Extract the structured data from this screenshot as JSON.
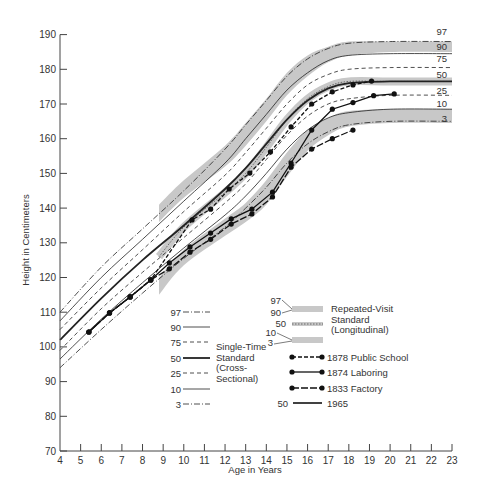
{
  "chart_data": {
    "type": "line",
    "title": "",
    "xlabel": "Age in Years",
    "ylabel": "Height in Centimeters",
    "xlim": [
      4,
      23
    ],
    "ylim": [
      70,
      190
    ],
    "x_ticks": [
      4,
      5,
      6,
      7,
      8,
      9,
      10,
      11,
      12,
      13,
      14,
      15,
      16,
      17,
      18,
      19,
      20,
      21,
      22,
      23
    ],
    "y_ticks": [
      70,
      80,
      90,
      100,
      110,
      120,
      130,
      140,
      150,
      160,
      170,
      180,
      190
    ],
    "grid": false,
    "cross_sectional_percentiles": [
      {
        "name": "97",
        "style": "dash-dot",
        "points": [
          [
            4,
            110
          ],
          [
            6,
            123
          ],
          [
            8,
            134
          ],
          [
            10,
            145
          ],
          [
            12,
            157
          ],
          [
            13,
            164
          ],
          [
            14,
            171
          ],
          [
            15,
            178
          ],
          [
            16,
            183
          ],
          [
            17,
            186
          ],
          [
            18,
            187.5
          ],
          [
            20,
            188
          ],
          [
            23,
            188
          ]
        ]
      },
      {
        "name": "90",
        "style": "solid-thin",
        "points": [
          [
            4,
            107.5
          ],
          [
            6,
            120
          ],
          [
            8,
            131
          ],
          [
            10,
            142
          ],
          [
            12,
            153
          ],
          [
            13,
            160
          ],
          [
            14,
            167
          ],
          [
            15,
            174
          ],
          [
            16,
            179
          ],
          [
            17,
            182.5
          ],
          [
            18,
            184
          ],
          [
            20,
            184.5
          ],
          [
            23,
            184.5
          ]
        ]
      },
      {
        "name": "75",
        "style": "dashed",
        "points": [
          [
            4,
            105
          ],
          [
            6,
            117
          ],
          [
            8,
            128
          ],
          [
            10,
            139
          ],
          [
            12,
            149.5
          ],
          [
            13,
            156
          ],
          [
            14,
            163
          ],
          [
            15,
            170
          ],
          [
            16,
            175.5
          ],
          [
            17,
            178.5
          ],
          [
            18,
            180
          ],
          [
            20,
            180.5
          ],
          [
            23,
            180.5
          ]
        ]
      },
      {
        "name": "50",
        "style": "solid-thick",
        "points": [
          [
            4,
            102
          ],
          [
            6,
            114
          ],
          [
            8,
            125
          ],
          [
            10,
            135
          ],
          [
            12,
            145.5
          ],
          [
            13,
            151.5
          ],
          [
            14,
            158.5
          ],
          [
            15,
            165.5
          ],
          [
            16,
            171
          ],
          [
            17,
            174.5
          ],
          [
            18,
            176
          ],
          [
            20,
            176.5
          ],
          [
            23,
            176.5
          ]
        ]
      },
      {
        "name": "25",
        "style": "dashed",
        "points": [
          [
            4,
            99
          ],
          [
            6,
            111
          ],
          [
            8,
            121.5
          ],
          [
            10,
            131.5
          ],
          [
            12,
            141.5
          ],
          [
            13,
            147
          ],
          [
            14,
            154
          ],
          [
            15,
            161
          ],
          [
            16,
            166.5
          ],
          [
            17,
            170
          ],
          [
            18,
            171.5
          ],
          [
            20,
            172.5
          ],
          [
            23,
            172.5
          ]
        ]
      },
      {
        "name": "10",
        "style": "solid-thin",
        "points": [
          [
            4,
            96.5
          ],
          [
            6,
            108
          ],
          [
            8,
            118.5
          ],
          [
            10,
            128.5
          ],
          [
            12,
            138
          ],
          [
            13,
            143.5
          ],
          [
            14,
            150
          ],
          [
            15,
            157
          ],
          [
            16,
            162.5
          ],
          [
            17,
            166
          ],
          [
            18,
            167.5
          ],
          [
            20,
            168.5
          ],
          [
            23,
            168.5
          ]
        ]
      },
      {
        "name": "3",
        "style": "dash-dot",
        "points": [
          [
            4,
            94
          ],
          [
            6,
            105
          ],
          [
            8,
            115.5
          ],
          [
            10,
            125.5
          ],
          [
            12,
            134.5
          ],
          [
            13,
            140
          ],
          [
            14,
            146
          ],
          [
            15,
            153
          ],
          [
            16,
            158.5
          ],
          [
            17,
            162
          ],
          [
            18,
            164
          ],
          [
            20,
            165
          ],
          [
            23,
            165
          ]
        ]
      }
    ],
    "longitudinal_bands": [
      {
        "name": "97-90",
        "points_upper": [
          [
            8.8,
            141
          ],
          [
            10,
            148
          ],
          [
            12,
            158
          ],
          [
            13,
            164.5
          ],
          [
            14,
            171.5
          ],
          [
            15,
            179
          ],
          [
            16,
            184
          ],
          [
            17,
            186.5
          ],
          [
            18,
            188
          ],
          [
            20,
            188
          ],
          [
            23,
            188
          ]
        ],
        "points_lower": [
          [
            8.8,
            136
          ],
          [
            10,
            143
          ],
          [
            12,
            152
          ],
          [
            13,
            158
          ],
          [
            14,
            165
          ],
          [
            15,
            172.5
          ],
          [
            16,
            178
          ],
          [
            17,
            182
          ],
          [
            18,
            184
          ],
          [
            20,
            185
          ],
          [
            23,
            185
          ]
        ]
      },
      {
        "name": "50",
        "points": [
          [
            8.8,
            126
          ],
          [
            10,
            134.5
          ],
          [
            12,
            144.5
          ],
          [
            13,
            150
          ],
          [
            14,
            157.5
          ],
          [
            15,
            165.5
          ],
          [
            16,
            171.5
          ],
          [
            17,
            175
          ],
          [
            18,
            176.5
          ],
          [
            20,
            176.5
          ],
          [
            23,
            176.5
          ]
        ]
      },
      {
        "name": "10-3",
        "points_upper": [
          [
            8.8,
            120
          ],
          [
            10,
            128
          ],
          [
            12,
            137
          ],
          [
            13,
            141.5
          ],
          [
            14,
            148
          ],
          [
            15,
            156
          ],
          [
            16,
            162.5
          ],
          [
            17,
            166
          ],
          [
            18,
            168
          ],
          [
            20,
            168.5
          ],
          [
            23,
            168.5
          ]
        ],
        "points_lower": [
          [
            8.8,
            115
          ],
          [
            10,
            123.5
          ],
          [
            12,
            132
          ],
          [
            13,
            136
          ],
          [
            14,
            141
          ],
          [
            15,
            149
          ],
          [
            16,
            156.5
          ],
          [
            17,
            161
          ],
          [
            18,
            163.5
          ],
          [
            20,
            164.5
          ],
          [
            23,
            164.5
          ]
        ]
      }
    ],
    "series": [
      {
        "name": "1878 Public School",
        "style": "dashed-dots",
        "points": [
          [
            5.4,
            104.3
          ],
          [
            6.4,
            109.8
          ],
          [
            7.4,
            114.4
          ],
          [
            8.4,
            119.3
          ],
          [
            10.4,
            136.6
          ],
          [
            11.3,
            139.7
          ],
          [
            12.2,
            145.5
          ],
          [
            13.2,
            150.1
          ],
          [
            14.2,
            156.2
          ],
          [
            15.2,
            163.4
          ],
          [
            16.2,
            170
          ],
          [
            17.2,
            173.5
          ],
          [
            18.2,
            175.5
          ],
          [
            19.1,
            176.6
          ]
        ]
      },
      {
        "name": "1874 Laboring",
        "style": "solid-dots",
        "points": [
          [
            5.4,
            104.3
          ],
          [
            6.4,
            109.8
          ],
          [
            7.4,
            114.4
          ],
          [
            8.4,
            119.3
          ],
          [
            9.3,
            124.2
          ],
          [
            10.3,
            128.8
          ],
          [
            11.3,
            132.8
          ],
          [
            12.3,
            136.9
          ],
          [
            13.3,
            139.7
          ],
          [
            14.3,
            144.6
          ],
          [
            15.2,
            153
          ],
          [
            16.2,
            162.5
          ],
          [
            17.2,
            168.5
          ],
          [
            18.2,
            170.4
          ],
          [
            19.2,
            172.4
          ],
          [
            20.2,
            172.9
          ]
        ]
      },
      {
        "name": "1833 Factory",
        "style": "dash-long-dots",
        "points": [
          [
            5.4,
            104.3
          ],
          [
            6.4,
            109.8
          ],
          [
            7.4,
            114.4
          ],
          [
            8.4,
            119.3
          ],
          [
            9.3,
            122.5
          ],
          [
            10.3,
            127.3
          ],
          [
            11.3,
            131
          ],
          [
            12.3,
            135.4
          ],
          [
            13.3,
            138.3
          ],
          [
            14.3,
            143.2
          ],
          [
            15.2,
            151.8
          ],
          [
            16.2,
            157
          ],
          [
            17.2,
            160
          ],
          [
            18.2,
            162.5
          ]
        ]
      },
      {
        "name": "1965",
        "style": "solid",
        "percentile": "50"
      }
    ],
    "right_labels": [
      "97",
      "90",
      "75",
      "50",
      "25",
      "10",
      "3"
    ],
    "legend": {
      "cross_sectional": {
        "entries": [
          "97",
          "90",
          "75",
          "50",
          "25",
          "10",
          "3"
        ],
        "title_lines": [
          "Single-Time",
          "Standard",
          "(Cross-",
          "Sectional)"
        ]
      },
      "longitudinal": {
        "entries": [
          "97",
          "90",
          "50",
          "10",
          "3"
        ],
        "title_lines": [
          "Repeated-Visit",
          "Standard",
          "(Longitudinal)"
        ]
      },
      "series_entries": [
        "1878 Public School",
        "1874 Laboring",
        "1833 Factory",
        "1965"
      ],
      "series_1965_prefix": "50"
    }
  }
}
